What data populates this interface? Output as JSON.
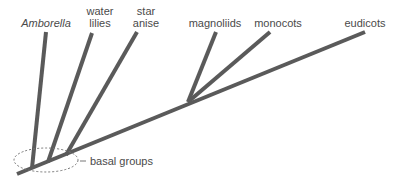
{
  "diagram": {
    "type": "phylogenetic-tree",
    "taxa": [
      {
        "label": "Amborella",
        "italic": true
      },
      {
        "label_line1": "water",
        "label_line2": "lilies"
      },
      {
        "label_line1": "star",
        "label_line2": "anise"
      },
      {
        "label": "magnoliids"
      },
      {
        "label": "monocots"
      },
      {
        "label": "eudicots"
      }
    ],
    "annotation": {
      "label": "basal groups"
    },
    "colors": {
      "branch": "#5a5a5a",
      "text": "#4a4a4a",
      "ellipse": "#777777"
    }
  }
}
